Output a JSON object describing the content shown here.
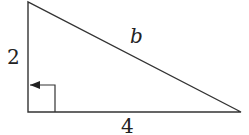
{
  "diagram": {
    "type": "right-triangle",
    "vertices": {
      "top": [
        28,
        2
      ],
      "right_angle": [
        28,
        112
      ],
      "right": [
        241,
        112
      ]
    },
    "labels": {
      "vertical_leg": "2",
      "horizontal_leg": "4",
      "hypotenuse": "b"
    },
    "stroke_color": "#333333"
  }
}
